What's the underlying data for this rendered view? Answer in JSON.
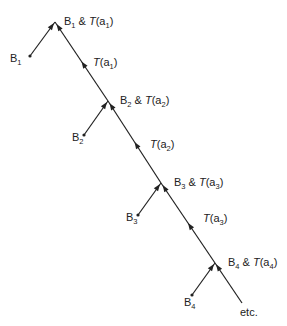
{
  "diagram": {
    "stroke_color": "#222222",
    "background": "#ffffff",
    "nodes": [
      {
        "id": "B1",
        "start_label": {
          "main": "B",
          "sub": "1"
        },
        "junction_label": {
          "b": "B",
          "b_sub": "1",
          "amp": " & ",
          "t": "T",
          "arg": "a",
          "arg_sub": "1"
        }
      },
      {
        "id": "B2",
        "start_label": {
          "main": "B",
          "sub": "2"
        },
        "junction_label": {
          "b": "B",
          "b_sub": "2",
          "amp": " & ",
          "t": "T",
          "arg": "a",
          "arg_sub": "2"
        }
      },
      {
        "id": "B3",
        "start_label": {
          "main": "B",
          "sub": "3"
        },
        "junction_label": {
          "b": "B",
          "b_sub": "3",
          "amp": " & ",
          "t": "T",
          "arg": "a",
          "arg_sub": "3"
        }
      },
      {
        "id": "B4",
        "start_label": {
          "main": "B",
          "sub": "4"
        },
        "junction_label": {
          "b": "B",
          "b_sub": "4",
          "amp": " & ",
          "t": "T",
          "arg": "a",
          "arg_sub": "4"
        }
      }
    ],
    "segment_labels": [
      {
        "t": "T",
        "arg": "(a",
        "arg_sub": "1",
        "close": ")"
      },
      {
        "t": "T",
        "arg": "(a",
        "arg_sub": "2",
        "close": ")"
      },
      {
        "t": "T",
        "arg": "(a",
        "arg_sub": "3",
        "close": ")"
      }
    ],
    "tail_label": "etc."
  }
}
